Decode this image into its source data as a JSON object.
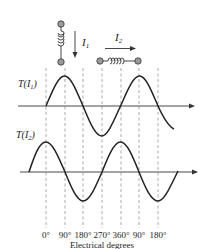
{
  "figure": {
    "coil_labels": {
      "i1": "I",
      "i1_sub": "1",
      "i2": "I",
      "i2_sub": "2"
    },
    "waveform_labels": {
      "t1": "T(I",
      "t1_sub": "1",
      "t1_close": ")",
      "t2": "T(I",
      "t2_sub": "2",
      "t2_close": ")"
    },
    "tick_labels": [
      "0°",
      "90°",
      "180°",
      "270°",
      "360°",
      "90°",
      "180°"
    ],
    "xlabel": "Electrical degrees",
    "colors": {
      "line": "#222222",
      "dash": "#888888",
      "coil_dot": "#9a9a9a"
    }
  }
}
